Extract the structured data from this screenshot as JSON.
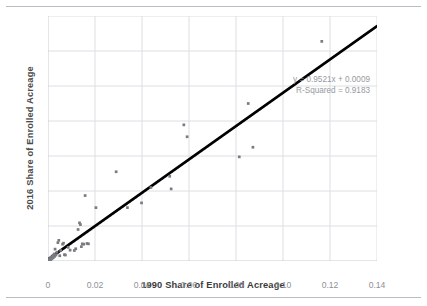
{
  "chart_data": {
    "type": "scatter",
    "title": "",
    "xlabel": "1990 Share of Enrolled Acreage",
    "ylabel": "2016 Share of Enrolled Acreage",
    "xlim": [
      0,
      0.14
    ],
    "ylim": [
      0,
      0.14
    ],
    "xticks": [
      "0",
      "0.02",
      "0.04",
      "0.06",
      "0.08",
      "0.10",
      "0.12",
      "0.14"
    ],
    "xtick_values": [
      0,
      0.02,
      0.04,
      0.06,
      0.08,
      0.1,
      0.12,
      0.14
    ],
    "yticks": [
      "0",
      "0.02",
      "0.04",
      "0.06",
      "0.08",
      "0.10",
      "0.12",
      "0.14"
    ],
    "ytick_values": [
      0,
      0.02,
      0.04,
      0.06,
      0.08,
      0.1,
      0.12,
      0.14
    ],
    "grid": true,
    "legend": "none",
    "marker_color": "#787b80",
    "trendline_color": "#000000",
    "reference_line_color": "#b0b0b0",
    "annotations": [
      "y = 0.9521x + 0.0009",
      "R-Squared = 0.9183"
    ],
    "fit": {
      "slope": 0.9521,
      "intercept": 0.0009,
      "r_squared": 0.9183
    },
    "points": [
      [
        0.0004,
        0.0006
      ],
      [
        0.0006,
        0.001
      ],
      [
        0.0008,
        0.0004
      ],
      [
        0.001,
        0.0016
      ],
      [
        0.0012,
        0.0008
      ],
      [
        0.0014,
        0.0022
      ],
      [
        0.0016,
        0.0013
      ],
      [
        0.002,
        0.003
      ],
      [
        0.0022,
        0.0018
      ],
      [
        0.0026,
        0.004
      ],
      [
        0.0028,
        0.0026
      ],
      [
        0.003,
        0.0068
      ],
      [
        0.0034,
        0.0034
      ],
      [
        0.0038,
        0.005
      ],
      [
        0.0042,
        0.0105
      ],
      [
        0.0046,
        0.0118
      ],
      [
        0.005,
        0.003
      ],
      [
        0.0054,
        0.006
      ],
      [
        0.0062,
        0.0096
      ],
      [
        0.0066,
        0.0102
      ],
      [
        0.007,
        0.0036
      ],
      [
        0.0074,
        0.0034
      ],
      [
        0.0086,
        0.0078
      ],
      [
        0.0094,
        0.0062
      ],
      [
        0.0112,
        0.006
      ],
      [
        0.0118,
        0.007
      ],
      [
        0.0128,
        0.018
      ],
      [
        0.0134,
        0.0218
      ],
      [
        0.0138,
        0.0208
      ],
      [
        0.0142,
        0.0082
      ],
      [
        0.0146,
        0.0098
      ],
      [
        0.0152,
        0.0096
      ],
      [
        0.0158,
        0.0374
      ],
      [
        0.0166,
        0.01
      ],
      [
        0.0172,
        0.0098
      ],
      [
        0.0204,
        0.0305
      ],
      [
        0.029,
        0.051
      ],
      [
        0.0338,
        0.0305
      ],
      [
        0.0398,
        0.0332
      ],
      [
        0.0438,
        0.042
      ],
      [
        0.0518,
        0.0484
      ],
      [
        0.0524,
        0.0412
      ],
      [
        0.0578,
        0.0778
      ],
      [
        0.0592,
        0.071
      ],
      [
        0.0814,
        0.0595
      ],
      [
        0.0852,
        0.09
      ],
      [
        0.0872,
        0.065
      ],
      [
        0.1165,
        0.1255
      ]
    ]
  }
}
